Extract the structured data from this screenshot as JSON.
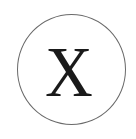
{
  "icon": {
    "name": "close-circle-icon",
    "glyph": "X",
    "shape": "circle",
    "stroke_color": "#6a6a6a",
    "glyph_color": "#1a1a1a",
    "background_color": "#ffffff"
  }
}
